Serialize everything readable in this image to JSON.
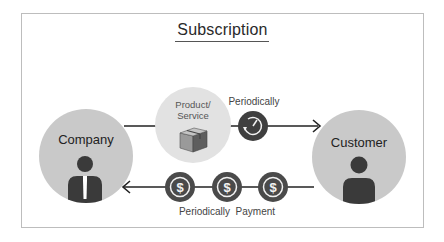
{
  "title": "Subscription",
  "nodes": {
    "company": {
      "label": "Company",
      "icon": "businessman-icon"
    },
    "customer": {
      "label": "Customer",
      "icon": "person-icon"
    },
    "product": {
      "label_line1": "Product/",
      "label_line2": "Service",
      "icon": "box-icon"
    }
  },
  "flows": {
    "delivery": {
      "label": "Periodically",
      "icon": "clock-refresh-icon",
      "direction": "company-to-customer"
    },
    "payment": {
      "label": "Periodically  Payment",
      "icon": "dollar-coin-icon",
      "coin_count": 3,
      "direction": "customer-to-company"
    }
  },
  "colors": {
    "node_fill": "#c9c9c9",
    "product_fill": "#e2e2e2",
    "icon_dark": "#3a3a3a",
    "line": "#222222",
    "frame": "#bdbdbd"
  }
}
